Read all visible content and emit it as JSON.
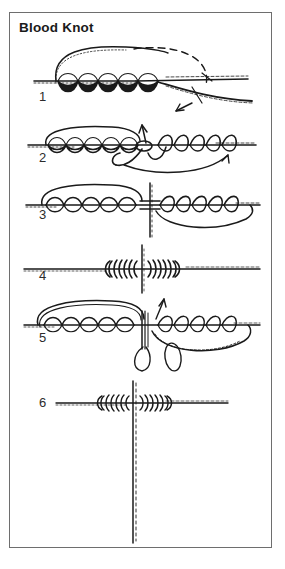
{
  "figure": {
    "title": "Blood Knot",
    "border_color": "#6e6e6e",
    "background_color": "#ffffff",
    "ink_color": "#1a1a1a",
    "width": 285,
    "height": 569
  },
  "steps": [
    {
      "number": "1",
      "name": "step-1",
      "x": 38,
      "y": 88,
      "description": "Two lines overlapped; left line wrapped around right line five turns, tag end brought back through; dashed arc and arrow show direction of wrapping."
    },
    {
      "number": "2",
      "name": "step-2",
      "x": 38,
      "y": 148,
      "description": "Right line wrapped around left line in the opposite direction; arrows show the tag ends passing through the center opening."
    },
    {
      "number": "3",
      "name": "step-3",
      "x": 38,
      "y": 205,
      "description": "Both tag ends inserted through the middle loop in opposite directions; vertical line shows the center gap."
    },
    {
      "number": "4",
      "name": "step-4",
      "x": 38,
      "y": 266,
      "description": "Knot pulled tight showing two opposing barrel coils seated against each other."
    },
    {
      "number": "5",
      "name": "step-5",
      "x": 38,
      "y": 328,
      "description": "Surgeon's-loop variation: a doubled line forms a dropper loop held at center while coils are formed on both sides; arrow shows loop pulled upward."
    },
    {
      "number": "6",
      "name": "step-6",
      "x": 38,
      "y": 393,
      "description": "Finished blood knot with dropper tag standing vertically from the center of the joined lines."
    }
  ],
  "icons": {
    "arrow": "arrow-icon",
    "dashed_guide": "dashed-guide-icon"
  }
}
